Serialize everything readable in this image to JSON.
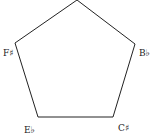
{
  "diagram": {
    "shape": "pentagon",
    "stroke_color": "#222222",
    "vertices": [
      {
        "id": "top",
        "label": ""
      },
      {
        "id": "right",
        "label": "B♭"
      },
      {
        "id": "bottom-right",
        "label": "C♯"
      },
      {
        "id": "bottom-left",
        "label": "E♭"
      },
      {
        "id": "left",
        "label": "F♯"
      }
    ]
  }
}
